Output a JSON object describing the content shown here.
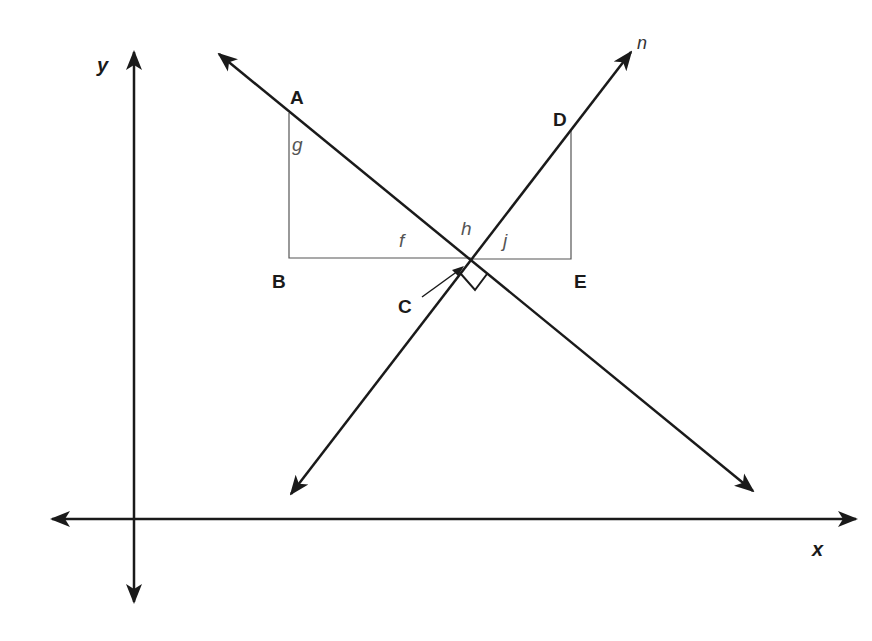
{
  "diagram": {
    "type": "coordinate-geometry",
    "axes": {
      "x_label": "x",
      "y_label": "y",
      "origin": [
        134,
        519
      ]
    },
    "lines": [
      {
        "name": "n",
        "label": "n",
        "from": [
          291,
          494
        ],
        "to": [
          631,
          52
        ],
        "both_arrows": true
      },
      {
        "name": "transversal",
        "from": [
          219,
          54
        ],
        "to": [
          753,
          491
        ],
        "both_arrows": true
      }
    ],
    "points": {
      "A": {
        "label": "A",
        "pos": [
          289,
          113
        ]
      },
      "B": {
        "label": "B",
        "pos": [
          289,
          258
        ]
      },
      "C": {
        "label": "C",
        "pos": [
          471,
          260
        ]
      },
      "D": {
        "label": "D",
        "pos": [
          571,
          131
        ]
      },
      "E": {
        "label": "E",
        "pos": [
          571,
          259
        ]
      }
    },
    "angle_labels": {
      "f": "f",
      "g": "g",
      "h": "h",
      "j": "j"
    },
    "right_angle_at": "C",
    "colors": {
      "line": "#1a1a1a",
      "thin_line": "#555555",
      "background": "#ffffff"
    }
  }
}
